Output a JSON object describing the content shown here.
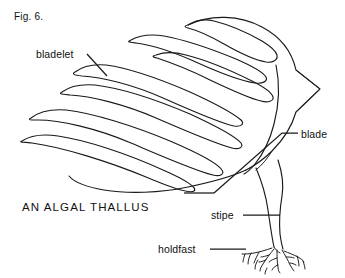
{
  "figure": {
    "number": "Fig. 6.",
    "caption": "AN ALGAL THALLUS",
    "background_color": "#ffffff",
    "ink_color": "#1a1a1a"
  },
  "labels": {
    "bladelet": "bladelet",
    "blade": "blade",
    "stipe": "stipe",
    "holdfast": "holdfast"
  },
  "parts": [
    {
      "name": "bladelet",
      "label": "bladelet",
      "description": "elongated finger-like frond segments"
    },
    {
      "name": "blade",
      "label": "blade",
      "description": "broad flattened leaf-like body with pointed tip"
    },
    {
      "name": "stipe",
      "label": "stipe",
      "description": "narrow tapering stalk"
    },
    {
      "name": "holdfast",
      "label": "holdfast",
      "description": "branching root-like anchor"
    }
  ]
}
